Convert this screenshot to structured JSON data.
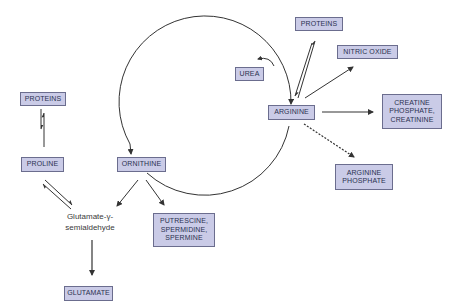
{
  "diagram": {
    "colors": {
      "box_fill": "#cacbe7",
      "box_border": "#6b6d8e",
      "box_text": "#2b3250",
      "line": "#333333"
    },
    "nodes": {
      "proteins_left": {
        "label": "PROTEINS"
      },
      "proline": {
        "label": "PROLINE"
      },
      "glutamate_semialdehyde": {
        "line1": "Glutamate-γ-",
        "line2": "semialdehyde"
      },
      "glutamate": {
        "label": "GLUTAMATE"
      },
      "ornithine": {
        "label": "ORNITHINE"
      },
      "polyamines": {
        "line1": "PUTRESCINE,",
        "line2": "SPERMIDINE,",
        "line3": "SPERMINE"
      },
      "urea": {
        "label": "UREA"
      },
      "proteins_top": {
        "label": "PROTEINS"
      },
      "nitric_oxide": {
        "label": "NITRIC OXIDE"
      },
      "arginine": {
        "label": "ARGININE"
      },
      "creatine": {
        "line1": "CREATINE",
        "line2": "PHOSPHATE,",
        "line3": "CREATININE"
      },
      "arginine_phosphate": {
        "line1": "ARGININE",
        "line2": "PHOSPHATE"
      }
    },
    "edges": [
      {
        "from": "PROTEINS",
        "to": "PROLINE",
        "type": "reversible"
      },
      {
        "from": "PROLINE",
        "to": "Glutamate-γ-semialdehyde",
        "type": "reversible"
      },
      {
        "from": "ORNITHINE",
        "to": "Glutamate-γ-semialdehyde",
        "type": "arrow"
      },
      {
        "from": "Glutamate-γ-semialdehyde",
        "to": "GLUTAMATE",
        "type": "arrow"
      },
      {
        "from": "ORNITHINE",
        "to": "PUTRESCINE, SPERMIDINE, SPERMINE",
        "type": "arrow"
      },
      {
        "from": "ORNITHINE",
        "to": "ARGININE",
        "type": "cycle"
      },
      {
        "from": "ARGININE",
        "to": "ORNITHINE",
        "type": "cycle"
      },
      {
        "from": "cycle",
        "to": "UREA",
        "type": "arrow"
      },
      {
        "from": "PROTEINS",
        "to": "ARGININE",
        "type": "reversible"
      },
      {
        "from": "ARGININE",
        "to": "NITRIC OXIDE",
        "type": "arrow"
      },
      {
        "from": "ARGININE",
        "to": "CREATINE PHOSPHATE, CREATININE",
        "type": "arrow"
      },
      {
        "from": "ARGININE",
        "to": "ARGININE PHOSPHATE",
        "type": "dashed-arrow"
      }
    ]
  }
}
